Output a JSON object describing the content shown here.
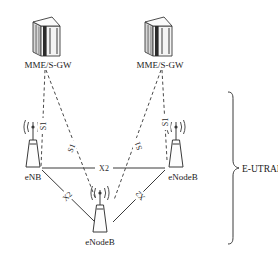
{
  "figure": {
    "background_color": "#ffffff",
    "line_color": "#3a3a3a",
    "text_color": "#1a1a1a"
  },
  "nodes": {
    "core_left": {
      "label": "MME/S-GW",
      "icon": "server-rack-icon",
      "x": 48,
      "y": 32
    },
    "core_right": {
      "label": "MME/S-GW",
      "icon": "server-rack-icon",
      "x": 160,
      "y": 32
    },
    "enb_left": {
      "label": "eNB",
      "icon": "antenna-tower-icon",
      "x": 33,
      "y": 152
    },
    "enb_right": {
      "label": "eNodeB",
      "icon": "antenna-tower-icon",
      "x": 207,
      "y": 152
    },
    "enb_bottom": {
      "label": "eNodeB",
      "icon": "antenna-tower-icon",
      "x": 100,
      "y": 213
    }
  },
  "links": [
    {
      "id": "s1-left-upper",
      "label": "S1",
      "style": "dashed",
      "from": "core_left",
      "to": "enb_left"
    },
    {
      "id": "s1-left-lower",
      "label": "S1",
      "style": "dashed",
      "from": "core_left",
      "to": "enb_bottom"
    },
    {
      "id": "s1-right-upper",
      "label": "S1",
      "style": "dashed",
      "from": "core_right",
      "to": "enb_right"
    },
    {
      "id": "s1-right-lower",
      "label": "S1",
      "style": "dashed",
      "from": "core_right",
      "to": "enb_bottom"
    },
    {
      "id": "x2-horizontal",
      "label": "X2",
      "style": "solid",
      "from": "enb_left",
      "to": "enb_right"
    },
    {
      "id": "x2-left-diagonal",
      "label": "X2",
      "style": "solid",
      "from": "enb_left",
      "to": "enb_bottom"
    },
    {
      "id": "x2-right-diagonal",
      "label": "X2",
      "style": "solid",
      "from": "enb_right",
      "to": "enb_bottom"
    }
  ],
  "group": {
    "label": "E-UTRAN",
    "bracket": "curly-brace-right"
  }
}
